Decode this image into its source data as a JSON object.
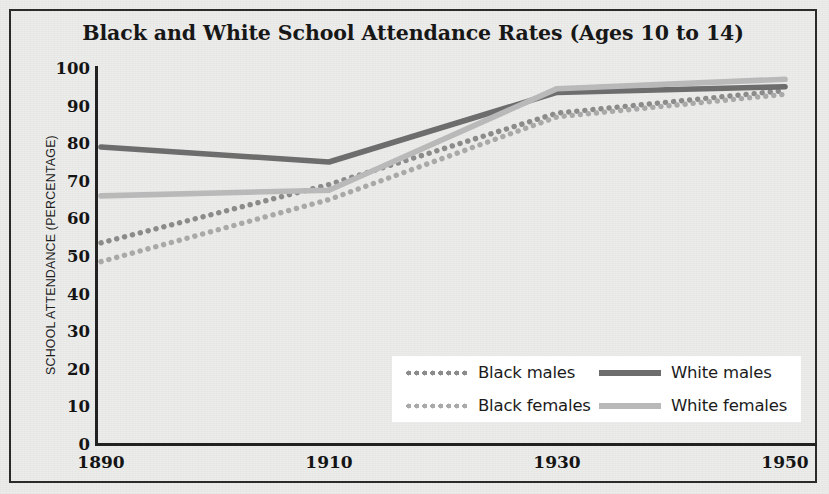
{
  "figure": {
    "title": "Black and White School Attendance Rates (Ages 10 to 14)",
    "background_color": "#ececeb",
    "border_color": "#2b2b2b"
  },
  "chart_data": {
    "type": "line",
    "title": "Black and White School Attendance Rates (Ages 10 to 14)",
    "xlabel": "",
    "ylabel": "SCHOOL ATTENDANCE (PERCENTAGE)",
    "x": [
      1890,
      1910,
      1930,
      1950
    ],
    "categories": [
      "1890",
      "1910",
      "1930",
      "1950"
    ],
    "xlim": [
      1890,
      1950
    ],
    "ylim": [
      0,
      100
    ],
    "ytick_labels": [
      "0",
      "10",
      "20",
      "30",
      "40",
      "50",
      "60",
      "70",
      "80",
      "90",
      "100"
    ],
    "ytick_values": [
      0,
      10,
      20,
      30,
      40,
      50,
      60,
      70,
      80,
      90,
      100
    ],
    "xtick_labels": [
      "1890",
      "1910",
      "1930",
      "1950"
    ],
    "grid": false,
    "legend_position": "lower right",
    "series": [
      {
        "name": "Black males",
        "values": [
          53.5,
          69,
          88,
          94
        ],
        "style": "dotted",
        "color": "#8b8b8b"
      },
      {
        "name": "Black females",
        "values": [
          48.5,
          65,
          87,
          93
        ],
        "style": "dotted",
        "color": "#a9a9a9"
      },
      {
        "name": "White males",
        "values": [
          79,
          75,
          93.5,
          95
        ],
        "style": "solid",
        "color": "#6d6d6d"
      },
      {
        "name": "White females",
        "values": [
          66,
          67.5,
          94.5,
          97
        ],
        "style": "solid",
        "color": "#b9b9b9"
      }
    ]
  },
  "legend": {
    "entries": [
      {
        "label": "Black males",
        "swatch": "dot-dark"
      },
      {
        "label": "White males",
        "swatch": "solid-dark"
      },
      {
        "label": "Black females",
        "swatch": "dot-light"
      },
      {
        "label": "White females",
        "swatch": "solid-light"
      }
    ]
  }
}
